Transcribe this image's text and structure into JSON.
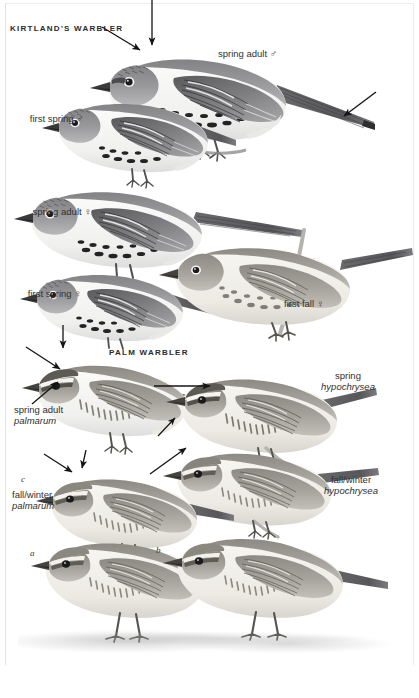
{
  "plate": {
    "headings": [
      {
        "text": "KIRTLAND'S WARBLER"
      },
      {
        "text": "PALM WARBLER"
      }
    ]
  },
  "kirtlands": {
    "title": "KIRTLAND'S WARBLER",
    "figures": [
      {
        "label": "spring adult",
        "sex": "♂"
      },
      {
        "label": "first spring",
        "sex": "♂"
      },
      {
        "label": "spring adult",
        "sex": "♀"
      },
      {
        "label": "first spring",
        "sex": "♀"
      },
      {
        "label": "first fall",
        "sex": "♀"
      }
    ]
  },
  "palm": {
    "title": "PALM WARBLER",
    "figures": [
      {
        "label": "spring adult",
        "subspecies": "palmarum"
      },
      {
        "label": "spring",
        "subspecies": "hypochrysea"
      },
      {
        "label": "fall/winter",
        "subspecies": "palmarum"
      },
      {
        "label": "fall/winter",
        "subspecies": "hypochrysea"
      }
    ],
    "markers": [
      {
        "text": "a"
      },
      {
        "text": "b"
      },
      {
        "text": "c"
      }
    ]
  },
  "colors": {
    "ink": "#2f2f2f",
    "plumage_dark": "#6b6b6d",
    "plumage_mid": "#98989a",
    "plumage_light": "#cfcfd1",
    "belly": "#f3f3f1",
    "arrow": "#1a1a1a",
    "ground": "#9a9a9c"
  }
}
